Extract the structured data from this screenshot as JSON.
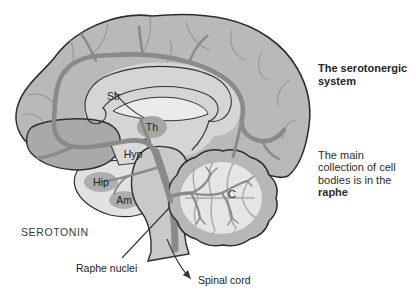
{
  "figure": {
    "serotonin_label": "SEROTONIN",
    "raphe_nuclei_label": "Raphe nuclei",
    "spinal_cord_label": "Spinal cord",
    "structures": {
      "striatum": "Str",
      "thalamus": "Th",
      "hypothalamus": "Hyp",
      "hippocampus": "Hip",
      "amygdala": "Am",
      "cerebellum": "C"
    }
  },
  "sidebar": {
    "title_line1": "The serotonergic",
    "title_line2": "system",
    "caption_line1": "The main",
    "caption_line2": "collection of cell",
    "caption_line3": "bodies is in the",
    "caption_line4_bold": "raphe"
  },
  "colors": {
    "background": "#ffffff",
    "cortex": "#b9b9b9",
    "temporal_lobe": "#a9a9a9",
    "inner_zone": "#d5d5d5",
    "basal_zone": "#e2e2e2",
    "nuclei_gray": "#a6a6a6",
    "brainstem": "#c9c9c9",
    "cerebellum_rim": "#b7b7b7",
    "cerebellum_core": "#e5e5e5",
    "serotonergic_pathway": "#8a8a8a",
    "outline": "#2e2e2e",
    "label_text": "#222222"
  }
}
